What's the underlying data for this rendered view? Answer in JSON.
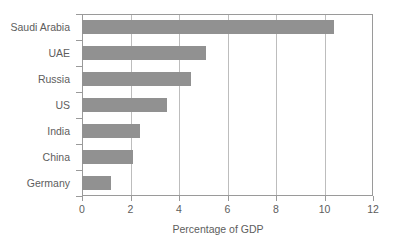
{
  "chart_data": {
    "type": "bar",
    "orientation": "horizontal",
    "title": "",
    "subtitle": "",
    "xlabel": "Percentage of GDP",
    "ylabel": "",
    "categories": [
      "Saudi Arabia",
      "UAE",
      "Russia",
      "US",
      "India",
      "China",
      "Germany"
    ],
    "values": [
      10.4,
      5.1,
      4.5,
      3.5,
      2.4,
      2.1,
      1.2
    ],
    "series": [
      {
        "name": "Percentage of GDP",
        "values": [
          10.4,
          5.1,
          4.5,
          3.5,
          2.4,
          2.1,
          1.2
        ]
      }
    ],
    "xlim": [
      0,
      12
    ],
    "xticks": [
      0,
      2,
      4,
      6,
      8,
      10,
      12
    ],
    "xtick_labels": [
      "0",
      "2",
      "4",
      "6",
      "8",
      "10",
      "12"
    ],
    "grid": "vertical",
    "legend": "none",
    "bar_color": "#919191",
    "axis_color": "#9a9a9a",
    "gridline_color": "#bdbdbd",
    "text_color": "#5d5d5d",
    "background": "#ffffff"
  }
}
